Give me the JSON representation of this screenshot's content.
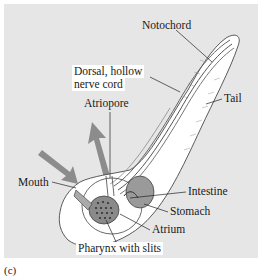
{
  "figure": {
    "panel_letter": "(c)",
    "background_color": "#e6e6e6",
    "body_color": "#ffffff",
    "organ_color": "#9a9a9a",
    "arrow_color": "#8c8c8c"
  },
  "labels": {
    "notochord": "Notochord",
    "nerve_cord_line1": "Dorsal, hollow",
    "nerve_cord_line2": "nerve cord",
    "tail": "Tail",
    "atriopore": "Atriopore",
    "mouth": "Mouth",
    "intestine": "Intestine",
    "stomach": "Stomach",
    "atrium": "Atrium",
    "pharynx": "Pharynx with slits"
  }
}
